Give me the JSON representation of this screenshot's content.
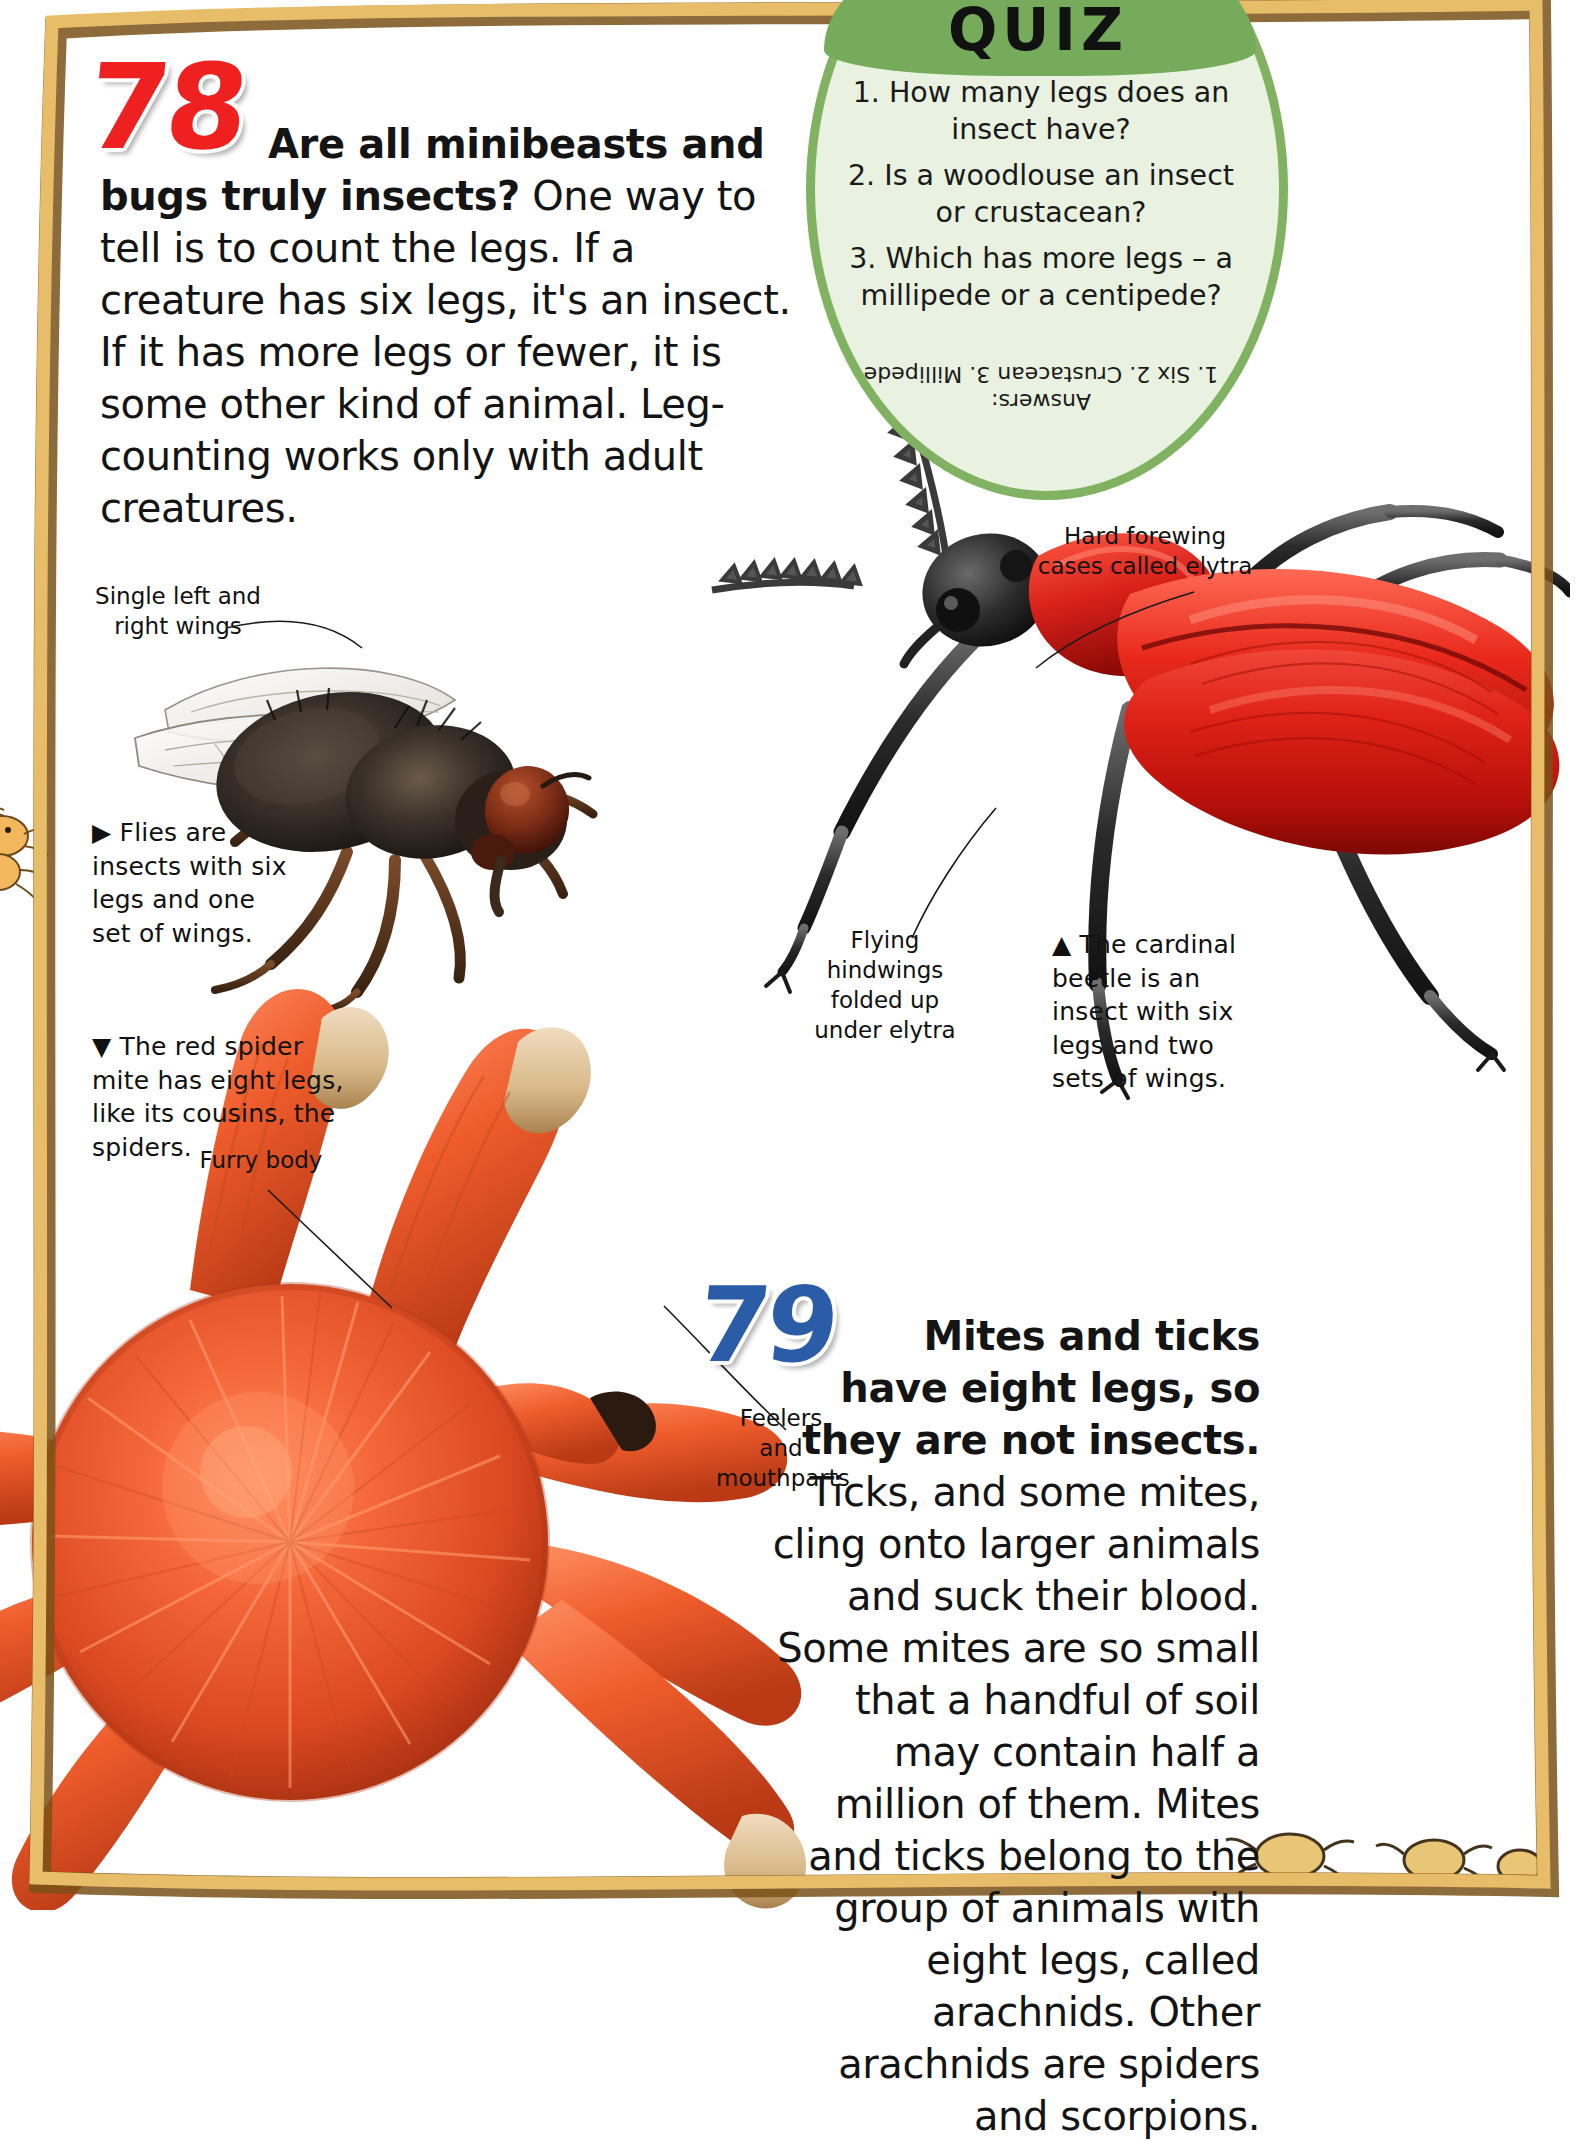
{
  "page": {
    "background": "#ffffff",
    "frame_color": "#e0b15c",
    "frame_shadow": "#7a5118"
  },
  "facts": [
    {
      "number": "78",
      "number_color": "#ee2020",
      "lead": "Are all minibeasts and bugs truly insects?",
      "body": " One way to tell is to count the legs. If a creature has six legs, it's an insect. If it has more legs or fewer, it is some other kind of animal. Leg-counting works only with adult creatures."
    },
    {
      "number": "79",
      "number_color": "#2a5ca8",
      "lead": "Mites and ticks have eight legs, so they are not insects.",
      "body": " Ticks, and some mites, cling onto larger animals and suck their blood. Some mites are so small that a handful of soil may contain half a million of them. Mites and ticks belong to the group of animals with eight legs, called arachnids. Other arachnids are spiders and scorpions."
    }
  ],
  "quiz": {
    "title": "QUIZ",
    "banner_color": "#76ab5b",
    "disc_color": "#e9f2e0",
    "border_color": "#80b262",
    "questions": [
      "1. How many legs does an insect have?",
      "2. Is a woodlouse an insect or crustacean?",
      "3. Which has more legs – a millipede or a centipede?"
    ],
    "answers_label": "Answers:",
    "answers": "1. Six  2. Crustacean  3. Millipede"
  },
  "callouts": [
    {
      "id": "wings",
      "text": "Single left and right wings"
    },
    {
      "id": "elytra",
      "text": "Hard forewing cases called elytra"
    },
    {
      "id": "hindwings",
      "text": "Flying hindwings folded up under elytra"
    },
    {
      "id": "furry-body",
      "text": "Furry body"
    },
    {
      "id": "feelers",
      "text": "Feelers and mouthparts"
    }
  ],
  "captions": [
    {
      "id": "fly",
      "marker": "▶",
      "text": "Flies are insects with six legs and one set of wings."
    },
    {
      "id": "beetle",
      "marker": "▲",
      "text": "The cardinal beetle is an insect with six legs and two sets of wings."
    },
    {
      "id": "mite",
      "marker": "▼",
      "text": "The red spider mite has eight legs, like its cousins, the spiders."
    }
  ],
  "artwork": [
    {
      "id": "housefly",
      "name": "housefly-photo"
    },
    {
      "id": "cardinal-beetle",
      "name": "cardinal-beetle-illustration"
    },
    {
      "id": "red-spider-mite",
      "name": "red-spider-mite-illustration"
    }
  ]
}
